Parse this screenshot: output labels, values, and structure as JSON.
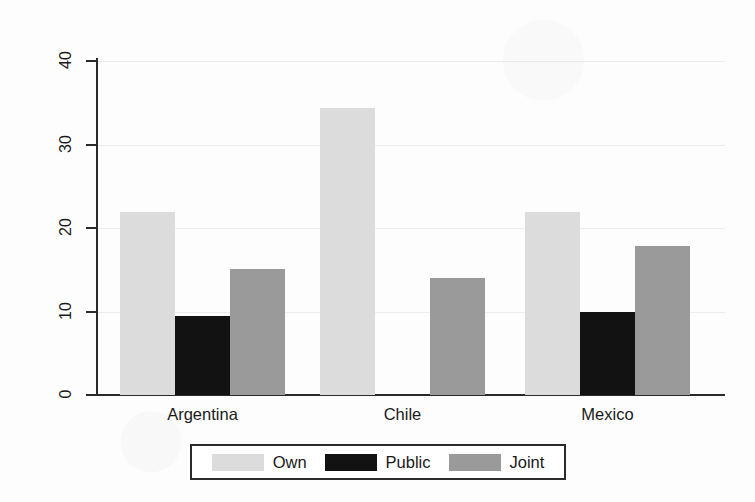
{
  "chart_data": {
    "type": "bar",
    "title": "",
    "xlabel": "",
    "ylabel": "Thousands of 2002 US$",
    "categories": [
      "Argentina",
      "Chile",
      "Mexico"
    ],
    "series": [
      {
        "name": "Own",
        "color": "#dcdcdc",
        "values": [
          21.9,
          34.4,
          21.9
        ]
      },
      {
        "name": "Public",
        "color": "#121212",
        "values": [
          9.5,
          0,
          10.0
        ]
      },
      {
        "name": "Joint",
        "color": "#9a9a9a",
        "values": [
          15.1,
          14.0,
          17.9
        ]
      }
    ],
    "ylim": [
      0,
      40
    ],
    "yticks": [
      0,
      10,
      20,
      30,
      40
    ],
    "ytick_labels": [
      "0",
      "10",
      "20",
      "30",
      "40"
    ],
    "grid": "horizontal-faint",
    "legend_position": "bottom",
    "legend_entries": [
      "Own",
      "Public",
      "Joint"
    ]
  }
}
